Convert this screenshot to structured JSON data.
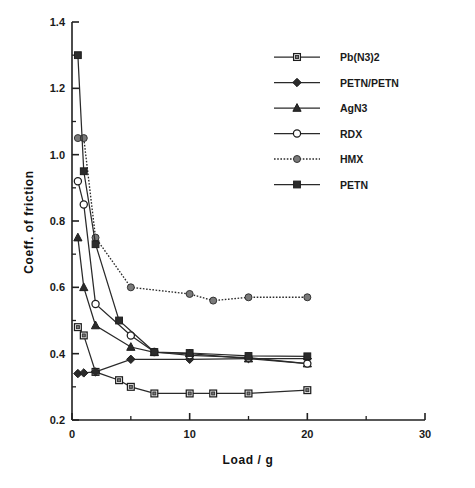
{
  "chart_data": {
    "type": "line",
    "title": "",
    "xlabel": "Load / g",
    "ylabel": "Coeff. of friction",
    "xlim": [
      0,
      30
    ],
    "ylim": [
      0.2,
      1.4
    ],
    "x_major_ticks": [
      0,
      10,
      20,
      30
    ],
    "x_major_tick_labels": [
      "0",
      "10",
      "20",
      "30"
    ],
    "x_minor_ticks": [
      5,
      15,
      25
    ],
    "y_major_ticks": [
      0.2,
      0.4,
      0.6,
      0.8,
      1.0,
      1.2,
      1.4
    ],
    "y_major_tick_labels": [
      "0.2",
      "0.4",
      "0.6",
      "0.8",
      "1.0",
      "1.2",
      "1.4"
    ],
    "y_minor_ticks": [
      0.3,
      0.5,
      0.7,
      0.9,
      1.1,
      1.3
    ],
    "grid": false,
    "legend_position": "upper right",
    "series": [
      {
        "name": "Pb(N3)2",
        "marker": "open-square",
        "linestyle": "solid",
        "x": [
          0.5,
          1,
          2,
          4,
          5,
          7,
          10,
          12,
          15,
          20
        ],
        "y": [
          0.48,
          0.455,
          0.345,
          0.32,
          0.3,
          0.28,
          0.28,
          0.28,
          0.28,
          0.29
        ]
      },
      {
        "name": "PETN/PETN",
        "marker": "filled-diamond",
        "linestyle": "solid",
        "x": [
          0.5,
          1,
          2,
          5,
          10,
          15,
          20
        ],
        "y": [
          0.34,
          0.342,
          0.345,
          0.383,
          0.383,
          0.385,
          0.385
        ]
      },
      {
        "name": "AgN3",
        "marker": "filled-triangle",
        "linestyle": "solid",
        "x": [
          0.5,
          1,
          2,
          5,
          7,
          10,
          15,
          20
        ],
        "y": [
          0.75,
          0.6,
          0.485,
          0.42,
          0.404,
          0.4,
          0.385,
          0.37
        ]
      },
      {
        "name": "RDX",
        "marker": "open-circle",
        "linestyle": "solid",
        "x": [
          0.5,
          1,
          2,
          5,
          7,
          10,
          15,
          20
        ],
        "y": [
          0.92,
          0.85,
          0.55,
          0.455,
          0.405,
          0.395,
          0.388,
          0.37
        ]
      },
      {
        "name": "HMX",
        "marker": "filled-circle",
        "linestyle": "dotted",
        "x": [
          0.5,
          1,
          2,
          5,
          10,
          12,
          15,
          20
        ],
        "y": [
          1.05,
          1.05,
          0.75,
          0.6,
          0.58,
          0.56,
          0.57,
          0.57
        ]
      },
      {
        "name": "PETN",
        "marker": "filled-square",
        "linestyle": "solid",
        "x": [
          0.5,
          1,
          2,
          4,
          7,
          10,
          15,
          20
        ],
        "y": [
          1.3,
          0.95,
          0.73,
          0.5,
          0.405,
          0.402,
          0.393,
          0.392
        ]
      }
    ]
  },
  "legend": {
    "entries": [
      {
        "label": "Pb(N3)2"
      },
      {
        "label": "PETN/PETN"
      },
      {
        "label": "AgN3"
      },
      {
        "label": "RDX"
      },
      {
        "label": "HMX"
      },
      {
        "label": "PETN"
      }
    ]
  }
}
